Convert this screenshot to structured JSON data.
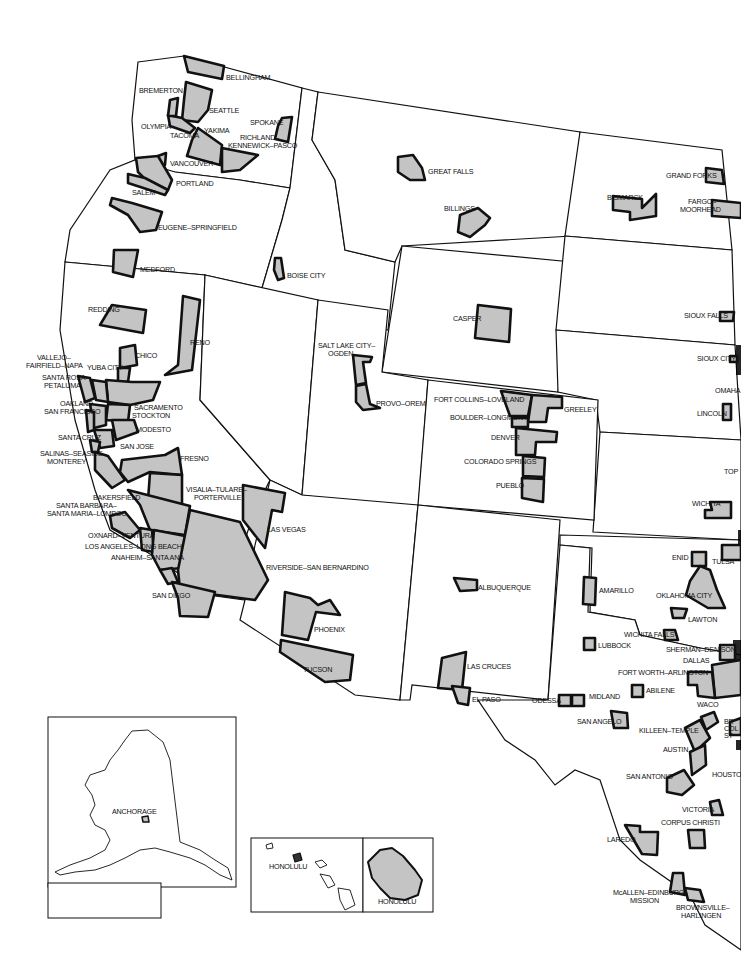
{
  "map": {
    "subject": "Metropolitan areas of the western United States",
    "colors": {
      "metro_fill": "#c4c4c4",
      "outline": "#111111",
      "background": "#ffffff"
    },
    "labels": {
      "bellingham": "BELLINGHAM",
      "bremerton": "BREMERTON",
      "seattle": "SEATTLE",
      "spokane": "SPOKANE",
      "olympia": "OLYMPIA",
      "tacoma": "TACOMA",
      "yakima": "YAKIMA",
      "richland_1": "RICHLAND–",
      "richland_2": "KENNEWICK–PASCO",
      "vancouver": "VANCOUVER",
      "portland": "PORTLAND",
      "salem": "SALEM",
      "eugene": "EUGENE–SPRINGFIELD",
      "medford": "MEDFORD",
      "boise": "BOISE CITY",
      "great_falls": "GREAT FALLS",
      "billings": "BILLINGS",
      "grand_forks": "GRAND FORKS",
      "bismarck": "BISMARCK",
      "fargo_1": "FARGO–",
      "fargo_2": "MOORHEAD",
      "redding": "REDDING",
      "reno": "RENO",
      "casper": "CASPER",
      "sioux_falls": "SIOUX FALLS",
      "sioux_city": "SIOUX CITY",
      "chico": "CHICO",
      "vallejo_1": "VALLEJO–",
      "vallejo_2": "FAIRFIELD–NAPA",
      "yuba": "YUBA CITY",
      "santa_rosa_1": "SANTA ROSA–",
      "santa_rosa_2": "PETALUMA",
      "slc_1": "SALT LAKE CITY–",
      "slc_2": "OGDEN",
      "omaha": "OMAHA",
      "oakland": "OAKLAND–",
      "san_francisco": "SAN FRANCISCO",
      "sacramento": "SACRAMENTO",
      "stockton": "STOCKTON",
      "modesto": "MODESTO",
      "provo": "PROVO–OREM",
      "fort_collins": "FORT COLLINS–LOVELAND",
      "greeley": "GREELEY",
      "boulder": "BOULDER–LONGMONT",
      "lincoln": "LINCOLN",
      "denver": "DENVER",
      "santa_cruz": "SANTA CRUZ",
      "san_jose": "SAN JOSE",
      "salinas_1": "SALINAS–SEASIDE–",
      "salinas_2": "MONTEREY",
      "fresno": "FRESNO",
      "colorado_springs": "COLORADO SPRINGS",
      "pueblo": "PUEBLO",
      "topeka": "TOP",
      "visalia_1": "VISALIA–TULARE–",
      "visalia_2": "PORTERVILLE",
      "bakersfield": "BAKERSFIELD",
      "las_vegas": "LAS VEGAS",
      "wichita": "WICHITA",
      "santa_barbara_1": "SANTA BARBARA–",
      "santa_barbara_2": "SANTA MARIA–LOMPOC",
      "oxnard": "OXNARD–VENTURA",
      "los_angeles": "LOS ANGELES–LONG BEACH",
      "anaheim": "ANAHEIM–SANTA ANA",
      "riverside": "RIVERSIDE–SAN BERNARDINO",
      "enid": "ENID",
      "tulsa": "TULSA",
      "albuquerque": "ALBUQUERQUE",
      "amarillo": "AMARILLO",
      "oklahoma_city": "OKLAHOMA CITY",
      "san_diego": "SAN DIEGO",
      "phoenix": "PHOENIX",
      "lawton": "LAWTON",
      "wichita_falls": "WICHITA FALLS",
      "lubbock": "LUBBOCK",
      "sherman": "SHERMAN–DENISON",
      "dallas": "DALLAS",
      "las_cruces": "LAS CRUCES",
      "fort_worth": "FORT WORTH–ARLINGTON",
      "tucson": "TUCSON",
      "abilene": "ABILENE",
      "el_paso": "EL PASO",
      "odessa": "ODESSA",
      "midland": "MIDLAND",
      "waco": "WACO",
      "bryan_1": "BR",
      "bryan_2": "COL",
      "bryan_3": "ST",
      "san_angelo": "SAN ANGELO",
      "killeen": "KILLEEN–TEMPLE",
      "austin": "AUSTIN",
      "san_antonio": "SAN ANTONIO",
      "houston": "HOUSTO",
      "victoria": "VICTORIA",
      "corpus_christi": "CORPUS CHRISTI",
      "laredo": "LAREDO",
      "mcallen_1": "McALLEN–EDINBURG–",
      "mcallen_2": "MISSION",
      "brownsville_1": "BROWNSVILLE–",
      "brownsville_2": "HARLINGEN",
      "anchorage": "ANCHORAGE",
      "honolulu_islands": "HONOLULU",
      "honolulu_oahu": "HONOLULU"
    }
  }
}
